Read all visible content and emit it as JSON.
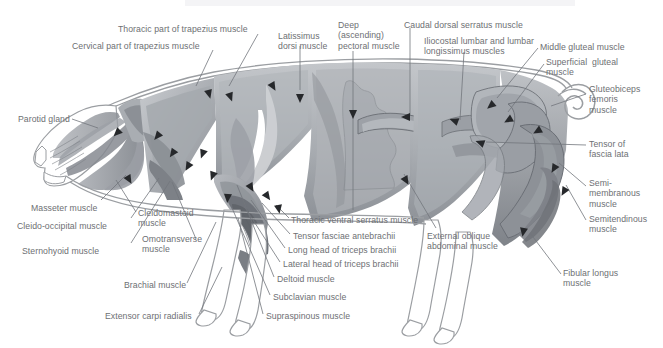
{
  "figure": {
    "background_color": "#ffffff",
    "label_color": "#6d6f73",
    "leader_line_color": "#6f7175",
    "outline_color": "#8a8c90",
    "palette": {
      "body_light": "#b9bcc0",
      "body_mid": "#9ea2a7",
      "body_dark": "#7c8086",
      "body_darker": "#6b6f75",
      "highlight": "#ffffff",
      "muscle_tint": "#a7abb0"
    }
  },
  "labels": [
    {
      "id": "thoracic-trapezius",
      "text": "Thoracic part of trapezius muscle",
      "x": 118,
      "y": 24,
      "align": "left"
    },
    {
      "id": "cervical-trapezius",
      "text": "Cervical part of trapezius muscle",
      "x": 72,
      "y": 41,
      "align": "left"
    },
    {
      "id": "latissimus-dorsi",
      "text": "Latissimus\ndorsi muscle",
      "x": 278,
      "y": 31,
      "align": "left"
    },
    {
      "id": "deep-pectoral",
      "text": "Deep\n(ascending)\npectoral muscle",
      "x": 338,
      "y": 20,
      "align": "left"
    },
    {
      "id": "caudal-dorsal-serratus",
      "text": "Caudal dorsal serratus muscle",
      "x": 404,
      "y": 20,
      "align": "left"
    },
    {
      "id": "iliocostal-lumbar",
      "text": "Iliocostal lumbar and lumbar\nlongissimus muscles",
      "x": 424,
      "y": 36,
      "align": "left"
    },
    {
      "id": "middle-gluteal",
      "text": "Middle gluteal muscle",
      "x": 540,
      "y": 42,
      "align": "left"
    },
    {
      "id": "superficial-gluteal",
      "text": "Superficial  gluteal\nmuscle",
      "x": 546,
      "y": 57,
      "align": "left"
    },
    {
      "id": "gluteobiceps-femoris",
      "text": "Gluteobiceps\nfemoris\nmuscle",
      "x": 589,
      "y": 84,
      "align": "left"
    },
    {
      "id": "parotid-gland",
      "text": "Parotid gland",
      "x": 18,
      "y": 114,
      "align": "left"
    },
    {
      "id": "tensor-fascia-lata",
      "text": "Tensor of\nfascia lata",
      "x": 589,
      "y": 139,
      "align": "left"
    },
    {
      "id": "semimembranous",
      "text": "Semi-\nmembranous\nmuscle",
      "x": 589,
      "y": 178,
      "align": "left"
    },
    {
      "id": "masseter",
      "text": "Masseter muscle",
      "x": 31,
      "y": 203,
      "align": "left"
    },
    {
      "id": "semitendinous",
      "text": "Semitendinous\nmuscle",
      "x": 589,
      "y": 214,
      "align": "left"
    },
    {
      "id": "cleido-occipital",
      "text": "Cleido-occipital muscle",
      "x": 17,
      "y": 221,
      "align": "left"
    },
    {
      "id": "cleidomastoid",
      "text": "Cleidomastoid\nmuscle",
      "x": 138,
      "y": 208,
      "align": "left"
    },
    {
      "id": "thoracic-ventral-serratus",
      "text": "Thoracic ventral serratus muscle",
      "x": 291,
      "y": 215,
      "align": "left"
    },
    {
      "id": "tensor-fasciae-antebrachii",
      "text": "Tensor fasciae antebrachii",
      "x": 293,
      "y": 231,
      "align": "left"
    },
    {
      "id": "omotransverse",
      "text": "Omotransverse\nmuscle",
      "x": 142,
      "y": 234,
      "align": "left"
    },
    {
      "id": "sternohyoid",
      "text": "Sternohyoid muscle",
      "x": 22,
      "y": 246,
      "align": "left"
    },
    {
      "id": "long-head-triceps",
      "text": "Long head of triceps brachii",
      "x": 288,
      "y": 245,
      "align": "left"
    },
    {
      "id": "external-oblique",
      "text": "External oblique\nabdominal muscle",
      "x": 427,
      "y": 231,
      "align": "left"
    },
    {
      "id": "lateral-head-triceps",
      "text": "Lateral head of triceps brachii",
      "x": 283,
      "y": 259,
      "align": "left"
    },
    {
      "id": "deltoid",
      "text": "Deltoid muscle",
      "x": 277,
      "y": 274,
      "align": "left"
    },
    {
      "id": "brachial",
      "text": "Brachial muscle",
      "x": 124,
      "y": 280,
      "align": "left"
    },
    {
      "id": "fibular-longus",
      "text": "Fibular longus\nmuscle",
      "x": 563,
      "y": 268,
      "align": "left"
    },
    {
      "id": "subclavian",
      "text": "Subclavian muscle",
      "x": 273,
      "y": 292,
      "align": "left"
    },
    {
      "id": "extensor-carpi-radialis",
      "text": "Extensor carpi radialis",
      "x": 105,
      "y": 311,
      "align": "left"
    },
    {
      "id": "supraspinous",
      "text": "Supraspinous muscle",
      "x": 266,
      "y": 311,
      "align": "left"
    }
  ],
  "leader_lines": [
    {
      "id": "ll-thoracic-trapezius",
      "points": "258,34 229,86"
    },
    {
      "id": "ll-cervical-trapezius",
      "points": "213,50 196,86"
    },
    {
      "id": "ll-latissimus",
      "points": "300,46 300,90"
    },
    {
      "id": "ll-deep-pectoral",
      "points": "353,51 353,210"
    },
    {
      "id": "ll-caudal-serratus",
      "points": "410,28 410,116"
    },
    {
      "id": "ll-iliocostal",
      "points": "464,52 460,120"
    },
    {
      "id": "ll-middle-gluteal",
      "points": "538,48 497,98"
    },
    {
      "id": "ll-superficial-gluteal",
      "points": "544,64 508,112"
    },
    {
      "id": "ll-gluteobiceps",
      "points": "586,94 551,106"
    },
    {
      "id": "ll-parotid",
      "points": "72,119 98,128"
    },
    {
      "id": "ll-tensor-fascia-lata",
      "points": "586,145 486,142"
    },
    {
      "id": "ll-semimembranous",
      "points": "586,186 559,163"
    },
    {
      "id": "ll-masseter",
      "points": "101,200 126,175"
    },
    {
      "id": "ll-semitendinous",
      "points": "586,220 566,185"
    },
    {
      "id": "ll-cleido-occipital",
      "points": "131,218 159,178"
    },
    {
      "id": "ll-cleidomastoid",
      "points": "136,212 116,180"
    },
    {
      "id": "ll-thoracic-ventral-serratus",
      "points": "289,218 276,205"
    },
    {
      "id": "ll-tensor-antebrachii",
      "points": "290,234 262,203"
    },
    {
      "id": "ll-omotransverse",
      "points": "196,239 172,182"
    },
    {
      "id": "ll-sternohyoid",
      "points": "131,243 170,181"
    },
    {
      "id": "ll-long-head",
      "points": "285,248 251,200"
    },
    {
      "id": "ll-external-oblique",
      "points": "436,228 404,174"
    },
    {
      "id": "ll-lateral-head",
      "points": "280,262 244,206"
    },
    {
      "id": "ll-deltoid",
      "points": "274,277 237,185"
    },
    {
      "id": "ll-brachial",
      "points": "187,283 216,222"
    },
    {
      "id": "ll-fibular-longus",
      "points": "561,274 530,233"
    },
    {
      "id": "ll-subclavian",
      "points": "270,295 232,208"
    },
    {
      "id": "ll-extensor-carpi",
      "points": "199,314 222,267"
    },
    {
      "id": "ll-supraspinous",
      "points": "263,314 238,218"
    }
  ],
  "arrowheads": [
    {
      "id": "ah-1",
      "x": 208,
      "y": 90,
      "angle": 75
    },
    {
      "id": "ah-2",
      "x": 229,
      "y": 93,
      "angle": 70
    },
    {
      "id": "ah-3",
      "x": 300,
      "y": 94,
      "angle": 90
    },
    {
      "id": "ah-4",
      "x": 271,
      "y": 83,
      "angle": 60
    },
    {
      "id": "ah-5",
      "x": 353,
      "y": 110,
      "angle": 90
    },
    {
      "id": "ah-6",
      "x": 410,
      "y": 117,
      "angle": 180
    },
    {
      "id": "ah-7",
      "x": 458,
      "y": 122,
      "angle": 200
    },
    {
      "id": "ah-8",
      "x": 494,
      "y": 103,
      "angle": 140
    },
    {
      "id": "ah-9",
      "x": 512,
      "y": 118,
      "angle": 150
    },
    {
      "id": "ah-10",
      "x": 541,
      "y": 129,
      "angle": 150
    },
    {
      "id": "ah-11",
      "x": 484,
      "y": 144,
      "angle": 200
    },
    {
      "id": "ah-12",
      "x": 120,
      "y": 130,
      "angle": 135
    },
    {
      "id": "ah-13",
      "x": 127,
      "y": 176,
      "angle": 60
    },
    {
      "id": "ah-14",
      "x": 160,
      "y": 133,
      "angle": 130
    },
    {
      "id": "ah-15",
      "x": 175,
      "y": 150,
      "angle": 125
    },
    {
      "id": "ah-16",
      "x": 190,
      "y": 163,
      "angle": 120
    },
    {
      "id": "ah-17",
      "x": 204,
      "y": 150,
      "angle": 110
    },
    {
      "id": "ah-18",
      "x": 214,
      "y": 172,
      "angle": 110
    },
    {
      "id": "ah-19",
      "x": 228,
      "y": 194,
      "angle": 95
    },
    {
      "id": "ah-20",
      "x": 249,
      "y": 184,
      "angle": 60
    },
    {
      "id": "ah-21",
      "x": 265,
      "y": 193,
      "angle": 55
    },
    {
      "id": "ah-22",
      "x": 278,
      "y": 205,
      "angle": 80
    },
    {
      "id": "ah-23",
      "x": 404,
      "y": 177,
      "angle": 60
    },
    {
      "id": "ah-24",
      "x": 524,
      "y": 228,
      "angle": 100
    },
    {
      "id": "ah-25",
      "x": 556,
      "y": 165,
      "angle": 120
    },
    {
      "id": "ah-26",
      "x": 566,
      "y": 188,
      "angle": 120
    }
  ]
}
